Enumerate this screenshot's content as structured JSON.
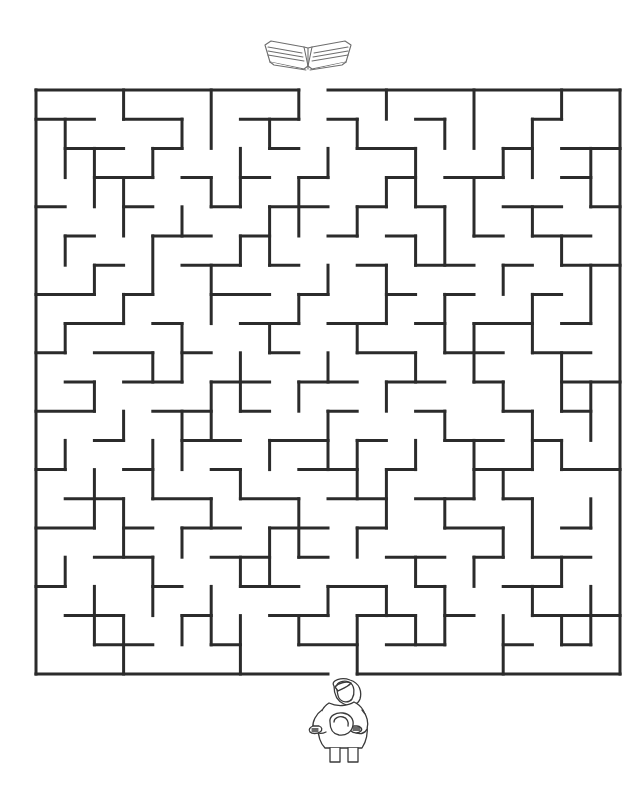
{
  "page": {
    "title": "Maze Puzzle",
    "background_color": "#ffffff",
    "width": 644,
    "height": 796
  },
  "maze": {
    "name": "book-maze",
    "wall_color": "#2b2b2b",
    "wall_thickness": 3,
    "origin_x": 36,
    "origin_y": 90,
    "cell_size": 29.2,
    "cols": 20,
    "rows": 20,
    "entrance": {
      "label": "entrance",
      "side": "top",
      "col": 9
    },
    "exit": {
      "label": "exit",
      "side": "bottom",
      "col": 10
    },
    "h_walls": [
      [
        0,
        0,
        9
      ],
      [
        0,
        10,
        20
      ],
      [
        1,
        0,
        2
      ],
      [
        1,
        3,
        5
      ],
      [
        1,
        7,
        9
      ],
      [
        1,
        10,
        11
      ],
      [
        1,
        13,
        14
      ],
      [
        1,
        17,
        18
      ],
      [
        2,
        1,
        3
      ],
      [
        2,
        4,
        5
      ],
      [
        2,
        8,
        9
      ],
      [
        2,
        11,
        13
      ],
      [
        2,
        16,
        17
      ],
      [
        2,
        18,
        20
      ],
      [
        3,
        2,
        4
      ],
      [
        3,
        5,
        6
      ],
      [
        3,
        7,
        8
      ],
      [
        3,
        9,
        10
      ],
      [
        3,
        12,
        13
      ],
      [
        3,
        14,
        16
      ],
      [
        3,
        18,
        19
      ],
      [
        4,
        0,
        1
      ],
      [
        4,
        3,
        4
      ],
      [
        4,
        6,
        7
      ],
      [
        4,
        8,
        10
      ],
      [
        4,
        11,
        12
      ],
      [
        4,
        13,
        14
      ],
      [
        4,
        16,
        18
      ],
      [
        4,
        19,
        20
      ],
      [
        5,
        1,
        2
      ],
      [
        5,
        4,
        6
      ],
      [
        5,
        7,
        8
      ],
      [
        5,
        10,
        11
      ],
      [
        5,
        12,
        13
      ],
      [
        5,
        15,
        16
      ],
      [
        5,
        17,
        19
      ],
      [
        6,
        2,
        3
      ],
      [
        6,
        5,
        7
      ],
      [
        6,
        8,
        9
      ],
      [
        6,
        11,
        12
      ],
      [
        6,
        13,
        15
      ],
      [
        6,
        16,
        17
      ],
      [
        6,
        18,
        20
      ],
      [
        7,
        0,
        2
      ],
      [
        7,
        3,
        4
      ],
      [
        7,
        6,
        8
      ],
      [
        7,
        9,
        10
      ],
      [
        7,
        12,
        13
      ],
      [
        7,
        14,
        15
      ],
      [
        7,
        17,
        18
      ],
      [
        8,
        1,
        3
      ],
      [
        8,
        4,
        5
      ],
      [
        8,
        7,
        9
      ],
      [
        8,
        10,
        12
      ],
      [
        8,
        13,
        14
      ],
      [
        8,
        15,
        17
      ],
      [
        8,
        18,
        19
      ],
      [
        9,
        0,
        1
      ],
      [
        9,
        2,
        4
      ],
      [
        9,
        5,
        6
      ],
      [
        9,
        8,
        9
      ],
      [
        9,
        11,
        13
      ],
      [
        9,
        14,
        16
      ],
      [
        9,
        17,
        19
      ],
      [
        10,
        1,
        2
      ],
      [
        10,
        3,
        5
      ],
      [
        10,
        6,
        8
      ],
      [
        10,
        9,
        11
      ],
      [
        10,
        12,
        14
      ],
      [
        10,
        15,
        16
      ],
      [
        10,
        18,
        20
      ],
      [
        11,
        0,
        2
      ],
      [
        11,
        4,
        6
      ],
      [
        11,
        7,
        8
      ],
      [
        11,
        10,
        11
      ],
      [
        11,
        13,
        14
      ],
      [
        11,
        16,
        17
      ],
      [
        11,
        18,
        19
      ],
      [
        12,
        2,
        3
      ],
      [
        12,
        5,
        7
      ],
      [
        12,
        8,
        10
      ],
      [
        12,
        11,
        12
      ],
      [
        12,
        14,
        16
      ],
      [
        12,
        17,
        18
      ],
      [
        13,
        0,
        1
      ],
      [
        13,
        3,
        4
      ],
      [
        13,
        6,
        7
      ],
      [
        13,
        9,
        11
      ],
      [
        13,
        12,
        13
      ],
      [
        13,
        15,
        17
      ],
      [
        13,
        18,
        20
      ],
      [
        14,
        1,
        3
      ],
      [
        14,
        4,
        6
      ],
      [
        14,
        7,
        9
      ],
      [
        14,
        10,
        12
      ],
      [
        14,
        13,
        15
      ],
      [
        14,
        16,
        17
      ],
      [
        15,
        0,
        2
      ],
      [
        15,
        3,
        4
      ],
      [
        15,
        5,
        7
      ],
      [
        15,
        8,
        10
      ],
      [
        15,
        11,
        12
      ],
      [
        15,
        14,
        16
      ],
      [
        15,
        18,
        19
      ],
      [
        16,
        2,
        4
      ],
      [
        16,
        6,
        8
      ],
      [
        16,
        9,
        10
      ],
      [
        16,
        12,
        14
      ],
      [
        16,
        15,
        16
      ],
      [
        16,
        17,
        19
      ],
      [
        17,
        0,
        1
      ],
      [
        17,
        4,
        5
      ],
      [
        17,
        7,
        9
      ],
      [
        17,
        10,
        12
      ],
      [
        17,
        13,
        14
      ],
      [
        17,
        16,
        18
      ],
      [
        18,
        1,
        3
      ],
      [
        18,
        5,
        6
      ],
      [
        18,
        8,
        10
      ],
      [
        18,
        11,
        13
      ],
      [
        18,
        14,
        15
      ],
      [
        18,
        17,
        20
      ],
      [
        19,
        2,
        4
      ],
      [
        19,
        6,
        7
      ],
      [
        19,
        9,
        11
      ],
      [
        19,
        12,
        14
      ],
      [
        19,
        16,
        17
      ],
      [
        19,
        18,
        19
      ],
      [
        20,
        0,
        10
      ],
      [
        20,
        11,
        20
      ]
    ],
    "v_walls": [
      [
        0,
        0,
        20
      ],
      [
        1,
        1,
        3
      ],
      [
        1,
        5,
        6
      ],
      [
        1,
        8,
        9
      ],
      [
        1,
        12,
        13
      ],
      [
        1,
        16,
        17
      ],
      [
        2,
        2,
        4
      ],
      [
        2,
        6,
        7
      ],
      [
        2,
        10,
        11
      ],
      [
        2,
        13,
        15
      ],
      [
        2,
        17,
        19
      ],
      [
        3,
        0,
        1
      ],
      [
        3,
        3,
        5
      ],
      [
        3,
        7,
        8
      ],
      [
        3,
        11,
        12
      ],
      [
        3,
        14,
        16
      ],
      [
        3,
        18,
        20
      ],
      [
        4,
        2,
        3
      ],
      [
        4,
        5,
        7
      ],
      [
        4,
        9,
        10
      ],
      [
        4,
        12,
        14
      ],
      [
        4,
        16,
        18
      ],
      [
        5,
        1,
        2
      ],
      [
        5,
        4,
        5
      ],
      [
        5,
        8,
        10
      ],
      [
        5,
        11,
        13
      ],
      [
        5,
        15,
        16
      ],
      [
        5,
        18,
        19
      ],
      [
        6,
        0,
        2
      ],
      [
        6,
        3,
        4
      ],
      [
        6,
        6,
        8
      ],
      [
        6,
        10,
        12
      ],
      [
        6,
        14,
        15
      ],
      [
        6,
        17,
        19
      ],
      [
        7,
        2,
        4
      ],
      [
        7,
        5,
        6
      ],
      [
        7,
        9,
        11
      ],
      [
        7,
        13,
        14
      ],
      [
        7,
        16,
        17
      ],
      [
        7,
        18,
        20
      ],
      [
        8,
        1,
        2
      ],
      [
        8,
        4,
        6
      ],
      [
        8,
        8,
        9
      ],
      [
        8,
        12,
        13
      ],
      [
        8,
        15,
        17
      ],
      [
        9,
        0,
        1
      ],
      [
        9,
        3,
        5
      ],
      [
        9,
        7,
        8
      ],
      [
        9,
        10,
        11
      ],
      [
        9,
        14,
        16
      ],
      [
        9,
        18,
        19
      ],
      [
        10,
        2,
        3
      ],
      [
        10,
        6,
        7
      ],
      [
        10,
        9,
        10
      ],
      [
        10,
        11,
        13
      ],
      [
        10,
        17,
        18
      ],
      [
        11,
        1,
        2
      ],
      [
        11,
        4,
        5
      ],
      [
        11,
        8,
        9
      ],
      [
        11,
        12,
        14
      ],
      [
        11,
        15,
        16
      ],
      [
        11,
        18,
        20
      ],
      [
        12,
        0,
        1
      ],
      [
        12,
        3,
        4
      ],
      [
        12,
        6,
        8
      ],
      [
        12,
        10,
        11
      ],
      [
        12,
        13,
        15
      ],
      [
        12,
        17,
        18
      ],
      [
        13,
        2,
        4
      ],
      [
        13,
        5,
        6
      ],
      [
        13,
        9,
        10
      ],
      [
        13,
        12,
        13
      ],
      [
        13,
        16,
        17
      ],
      [
        13,
        18,
        19
      ],
      [
        14,
        1,
        2
      ],
      [
        14,
        4,
        6
      ],
      [
        14,
        7,
        9
      ],
      [
        14,
        11,
        12
      ],
      [
        14,
        14,
        15
      ],
      [
        14,
        17,
        19
      ],
      [
        15,
        0,
        2
      ],
      [
        15,
        3,
        5
      ],
      [
        15,
        8,
        10
      ],
      [
        15,
        12,
        14
      ],
      [
        15,
        16,
        17
      ],
      [
        16,
        2,
        3
      ],
      [
        16,
        6,
        7
      ],
      [
        16,
        10,
        11
      ],
      [
        16,
        13,
        14
      ],
      [
        16,
        15,
        16
      ],
      [
        16,
        18,
        20
      ],
      [
        17,
        1,
        3
      ],
      [
        17,
        4,
        5
      ],
      [
        17,
        7,
        9
      ],
      [
        17,
        11,
        13
      ],
      [
        17,
        14,
        16
      ],
      [
        17,
        17,
        18
      ],
      [
        18,
        0,
        1
      ],
      [
        18,
        5,
        6
      ],
      [
        18,
        9,
        11
      ],
      [
        18,
        12,
        13
      ],
      [
        18,
        16,
        17
      ],
      [
        18,
        18,
        19
      ],
      [
        19,
        2,
        4
      ],
      [
        19,
        6,
        8
      ],
      [
        19,
        10,
        12
      ],
      [
        19,
        14,
        15
      ],
      [
        19,
        17,
        19
      ],
      [
        20,
        0,
        20
      ]
    ]
  },
  "book_icon": {
    "name": "open-book-icon",
    "label": "Open book",
    "stroke_color": "#6e6e6e",
    "fill_color": "#ffffff",
    "position": "top"
  },
  "person_icon": {
    "name": "person-reading-icon",
    "label": "Child holding a book",
    "stroke_color": "#3a3a3a",
    "fill_color": "#ffffff",
    "position": "bottom"
  }
}
